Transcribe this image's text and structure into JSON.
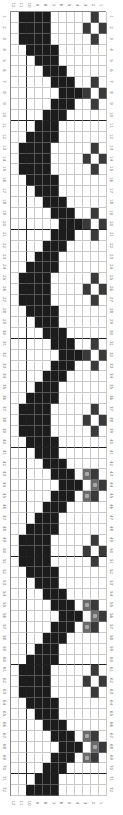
{
  "chart": {
    "title": "",
    "rows": 72,
    "columns": 12,
    "column_labels": [
      "12",
      "11",
      "10",
      "9",
      "8",
      "7",
      "6",
      "5",
      "4",
      "3",
      "2",
      "1"
    ],
    "row_labels": [
      "1",
      "2",
      "3",
      "4",
      "5",
      "6",
      "7",
      "8",
      "9",
      "10",
      "11",
      "12",
      "13",
      "14",
      "15",
      "16",
      "17",
      "18",
      "19",
      "20",
      "21",
      "22",
      "23",
      "24",
      "25",
      "26",
      "27",
      "28",
      "29",
      "30",
      "31",
      "32",
      "33",
      "34",
      "35",
      "36",
      "37",
      "38",
      "39",
      "40",
      "41",
      "42",
      "43",
      "44",
      "45",
      "46",
      "47",
      "48",
      "49",
      "50",
      "51",
      "52",
      "53",
      "54",
      "55",
      "56",
      "57",
      "58",
      "59",
      "60",
      "61",
      "62",
      "63",
      "64",
      "65",
      "66",
      "67",
      "68",
      "69",
      "70",
      "71",
      "72"
    ],
    "thick_row_every": 10,
    "thick_col_after_display_index": 1,
    "legend": {
      "k": "filled stitch (black)",
      "d": "motif stitch (dark)",
      "s": "motif stitch (gray with symbol)",
      "_": "empty"
    },
    "colors": {
      "filled": "#1c1c1c",
      "motif_dark": "#3a3a3a",
      "motif_symbol": "#6a6a6a",
      "grid": "#c8c8c8",
      "empty": "#ffffff"
    },
    "pattern_rows": [
      "_kkkk_____d_",
      "_kkkk____d_d",
      "_kkkk_____d_",
      "__kkkk______",
      "___kkk______",
      "____kkk_____",
      "_____kkk__d_",
      "______kkkd_d",
      "_____kkk__d_",
      "____kkk_____",
      "___kkk______",
      "__kkkk______",
      "_kkkk_____d_",
      "_kkkk____d_d",
      "_kkkk_____d_",
      "__kkkk______",
      "___kkk______",
      "____kkk_____",
      "_____kkk__d_",
      "______kkkd_d",
      "_____kkk__d_",
      "____kkk_____",
      "___kkk______",
      "__kkkk______",
      "_kkkk_____d_",
      "_kkkk____d_d",
      "_kkkk_____d_",
      "__kkkk______",
      "___kkk______",
      "____kkk_____",
      "_____kkk__d_",
      "______kkkd_d",
      "_____kkk__d_",
      "____kkk_____",
      "___kkk______",
      "__kkkk______",
      "_kkkk_____d_",
      "_kkkk____d_d",
      "_kkkk_____d_",
      "__kkkk______",
      "___kkk______",
      "____kkk_____",
      "_____kkk_sd_",
      "______kkk_sd",
      "_____kkk_sd_",
      "____kkk_____",
      "___kkk______",
      "__kkkk______",
      "_kkkk_____d_",
      "_kkkk____d_d",
      "_kkkk_____d_",
      "__kkkk______",
      "___kkk______",
      "____kkk_____",
      "_____kkk_sd_",
      "______kkk_sd",
      "_____kkk_sd_",
      "____kkk_____",
      "___kkk______",
      "__kkkk______",
      "_kkkk_____d_",
      "_kkkk____d_d",
      "_kkkk_____d_",
      "__kkkk______",
      "___kkk______",
      "____kkk_____",
      "_____kkk_sd_",
      "______kkk_sd",
      "_____kkk_sd_",
      "____kkk_____",
      "___kkk______",
      "__kkkk______"
    ]
  }
}
